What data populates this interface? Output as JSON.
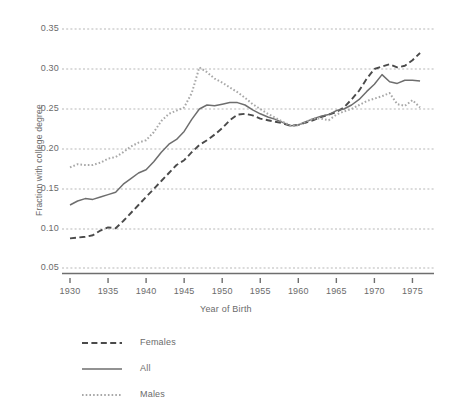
{
  "chart_data": {
    "type": "line",
    "title": "",
    "xlabel": "Year of Birth",
    "ylabel": "Fraction with college degree",
    "xlim": [
      1929,
      1976.5
    ],
    "ylim": [
      0.05,
      0.35
    ],
    "grid": true,
    "y_axis_break": true,
    "y_break_note": "spacing between 0.05 and 0.10 is larger than other intervals",
    "legend_position": "below-left",
    "xticks": [
      1930,
      1935,
      1940,
      1945,
      1950,
      1955,
      1960,
      1965,
      1970,
      1975
    ],
    "xtick_labels": [
      "1930",
      "1935",
      "1940",
      "1945",
      "1950",
      "1955",
      "1960",
      "1965",
      "1970",
      "1975"
    ],
    "yticks": [
      0.05,
      0.1,
      0.15,
      0.2,
      0.25,
      0.3,
      0.35
    ],
    "ytick_labels": [
      "0.05",
      "0.10",
      "0.15",
      "0.20",
      "0.25",
      "0.30",
      "0.35"
    ],
    "x": [
      1930,
      1931,
      1932,
      1933,
      1934,
      1935,
      1936,
      1937,
      1938,
      1939,
      1940,
      1941,
      1942,
      1943,
      1944,
      1945,
      1946,
      1947,
      1948,
      1949,
      1950,
      1951,
      1952,
      1953,
      1954,
      1955,
      1956,
      1957,
      1958,
      1959,
      1960,
      1961,
      1962,
      1963,
      1964,
      1965,
      1966,
      1967,
      1968,
      1969,
      1970,
      1971,
      1972,
      1973,
      1974,
      1975,
      1976
    ],
    "series": [
      {
        "name": "Females",
        "style": "dashed",
        "color": "#4a4a4a",
        "values": [
          0.088,
          0.089,
          0.09,
          0.092,
          0.098,
          0.102,
          0.101,
          0.11,
          0.12,
          0.13,
          0.14,
          0.15,
          0.16,
          0.17,
          0.18,
          0.186,
          0.196,
          0.205,
          0.211,
          0.218,
          0.226,
          0.236,
          0.243,
          0.244,
          0.242,
          0.238,
          0.236,
          0.234,
          0.232,
          0.229,
          0.23,
          0.233,
          0.236,
          0.24,
          0.243,
          0.246,
          0.252,
          0.262,
          0.273,
          0.288,
          0.3,
          0.303,
          0.306,
          0.302,
          0.304,
          0.311,
          0.32
        ]
      },
      {
        "name": "All",
        "style": "solid",
        "color": "#6e6e6e",
        "values": [
          0.13,
          0.135,
          0.138,
          0.137,
          0.14,
          0.143,
          0.146,
          0.156,
          0.163,
          0.17,
          0.174,
          0.184,
          0.196,
          0.206,
          0.212,
          0.222,
          0.237,
          0.25,
          0.255,
          0.254,
          0.256,
          0.258,
          0.258,
          0.255,
          0.249,
          0.244,
          0.24,
          0.237,
          0.233,
          0.229,
          0.23,
          0.234,
          0.238,
          0.241,
          0.243,
          0.248,
          0.25,
          0.255,
          0.262,
          0.272,
          0.281,
          0.293,
          0.284,
          0.282,
          0.286,
          0.286,
          0.285
        ]
      },
      {
        "name": "Males",
        "style": "dotted",
        "color": "#a8a8a8",
        "values": [
          0.177,
          0.181,
          0.18,
          0.18,
          0.183,
          0.188,
          0.19,
          0.196,
          0.203,
          0.208,
          0.211,
          0.221,
          0.235,
          0.244,
          0.248,
          0.252,
          0.27,
          0.302,
          0.296,
          0.288,
          0.283,
          0.277,
          0.271,
          0.264,
          0.256,
          0.25,
          0.244,
          0.239,
          0.234,
          0.229,
          0.23,
          0.234,
          0.238,
          0.238,
          0.236,
          0.243,
          0.247,
          0.25,
          0.255,
          0.26,
          0.263,
          0.266,
          0.27,
          0.256,
          0.254,
          0.261,
          0.252
        ]
      }
    ]
  },
  "legend": {
    "items": [
      {
        "label": "Females",
        "style": "dashed"
      },
      {
        "label": "All",
        "style": "solid"
      },
      {
        "label": "Males",
        "style": "dotted"
      }
    ]
  }
}
